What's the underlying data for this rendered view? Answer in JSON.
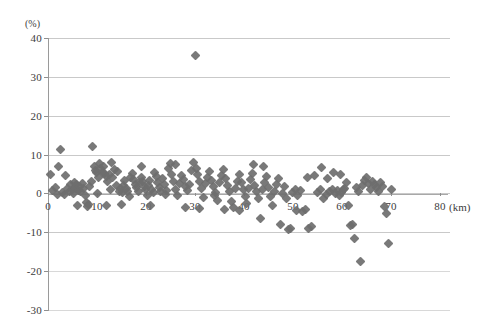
{
  "chart_data": {
    "type": "scatter",
    "title": "",
    "subtitle": "",
    "xlabel": "(km)",
    "ylabel": "(%)",
    "y_axis_title": "(%)",
    "x_axis_unit": "(km)",
    "xlim": [
      0,
      80
    ],
    "ylim": [
      -30,
      40
    ],
    "xticks": [
      0,
      10,
      20,
      30,
      40,
      50,
      60,
      70,
      80
    ],
    "xtick_labels": [
      "0",
      "10",
      "20",
      "30",
      "40",
      "50",
      "60",
      "70",
      "80"
    ],
    "yticks": [
      40,
      30,
      20,
      10,
      0,
      -10,
      -20,
      -30
    ],
    "ytick_labels": [
      "40",
      "30",
      "20",
      "10",
      "0",
      "-10",
      "-20",
      "-30"
    ],
    "grid": true,
    "grid_axis": "y",
    "legend": false,
    "legend_position": "none",
    "marker": "diamond",
    "marker_color": "#6e6e6e",
    "background_color": "#ffffff",
    "gridline_color": "#c9c9c9",
    "axis_color": "#8f8f8f",
    "series": [
      {
        "name": "series-1",
        "points": [
          [
            0.4,
            5.0
          ],
          [
            1.0,
            0.7
          ],
          [
            1.6,
            1.6
          ],
          [
            2.2,
            6.9
          ],
          [
            2.6,
            11.2
          ],
          [
            3.0,
            0.2
          ],
          [
            3.3,
            -0.3
          ],
          [
            3.6,
            4.7
          ],
          [
            4.0,
            1.3
          ],
          [
            4.3,
            0.6
          ],
          [
            4.6,
            2.2
          ],
          [
            4.9,
            1.0
          ],
          [
            5.2,
            0.1
          ],
          [
            5.4,
            2.9
          ],
          [
            5.6,
            1.2
          ],
          [
            5.9,
            2.4
          ],
          [
            6.2,
            0.8
          ],
          [
            6.4,
            1.9
          ],
          [
            6.7,
            0.4
          ],
          [
            7.0,
            2.6
          ],
          [
            7.3,
            1.4
          ],
          [
            7.6,
            -0.6
          ],
          [
            7.9,
            -2.4
          ],
          [
            8.2,
            -2.8
          ],
          [
            8.5,
            1.8
          ],
          [
            8.8,
            3.0
          ],
          [
            9.1,
            12.2
          ],
          [
            9.4,
            6.9
          ],
          [
            9.6,
            6.0
          ],
          [
            9.9,
            5.4
          ],
          [
            10.2,
            4.2
          ],
          [
            10.5,
            7.6
          ],
          [
            10.8,
            6.3
          ],
          [
            11.1,
            5.5
          ],
          [
            11.3,
            7.0
          ],
          [
            11.6,
            5.1
          ],
          [
            11.9,
            4.3
          ],
          [
            12.2,
            3.1
          ],
          [
            12.5,
            4.8
          ],
          [
            12.8,
            1.0
          ],
          [
            13.1,
            4.0
          ],
          [
            13.5,
            6.2
          ],
          [
            13.9,
            2.0
          ],
          [
            14.2,
            5.7
          ],
          [
            14.5,
            0.6
          ],
          [
            14.8,
            1.4
          ],
          [
            15.1,
            0.2
          ],
          [
            15.4,
            2.1
          ],
          [
            15.7,
            3.3
          ],
          [
            16.0,
            1.2
          ],
          [
            16.3,
            0.5
          ],
          [
            16.6,
            -0.8
          ],
          [
            16.9,
            4.2
          ],
          [
            17.2,
            5.2
          ],
          [
            17.5,
            3.6
          ],
          [
            17.8,
            2.4
          ],
          [
            18.1,
            1.5
          ],
          [
            18.4,
            0.4
          ],
          [
            18.7,
            2.7
          ],
          [
            19.0,
            4.1
          ],
          [
            19.3,
            3.0
          ],
          [
            19.6,
            1.8
          ],
          [
            19.9,
            0.9
          ],
          [
            20.2,
            -0.4
          ],
          [
            20.5,
            2.0
          ],
          [
            20.8,
            3.4
          ],
          [
            21.1,
            1.1
          ],
          [
            21.5,
            0.3
          ],
          [
            21.8,
            5.5
          ],
          [
            22.1,
            4.4
          ],
          [
            22.4,
            2.8
          ],
          [
            22.7,
            1.6
          ],
          [
            23.0,
            0.6
          ],
          [
            23.4,
            3.9
          ],
          [
            23.8,
            2.2
          ],
          [
            24.1,
            0.8
          ],
          [
            24.5,
            6.5
          ],
          [
            24.9,
            7.8
          ],
          [
            25.2,
            5.0
          ],
          [
            25.6,
            3.2
          ],
          [
            26.0,
            1.0
          ],
          [
            26.4,
            -0.5
          ],
          [
            26.8,
            2.6
          ],
          [
            27.2,
            4.6
          ],
          [
            27.6,
            3.7
          ],
          [
            28.0,
            1.9
          ],
          [
            28.4,
            0.7
          ],
          [
            28.8,
            2.3
          ],
          [
            29.2,
            5.8
          ],
          [
            29.6,
            7.9
          ],
          [
            30.0,
            35.5
          ],
          [
            30.2,
            6.4
          ],
          [
            30.6,
            4.9
          ],
          [
            31.0,
            3.1
          ],
          [
            31.4,
            1.3
          ],
          [
            31.8,
            -1.0
          ],
          [
            32.2,
            2.5
          ],
          [
            32.6,
            4.0
          ],
          [
            33.0,
            5.6
          ],
          [
            33.4,
            3.4
          ],
          [
            33.8,
            1.7
          ],
          [
            34.2,
            0.2
          ],
          [
            34.6,
            -1.8
          ],
          [
            35.0,
            2.9
          ],
          [
            35.4,
            4.5
          ],
          [
            35.8,
            6.1
          ],
          [
            36.2,
            3.8
          ],
          [
            36.6,
            2.0
          ],
          [
            37.0,
            0.5
          ],
          [
            37.4,
            -2.0
          ],
          [
            37.8,
            -3.6
          ],
          [
            38.2,
            1.4
          ],
          [
            38.6,
            3.0
          ],
          [
            39.0,
            4.8
          ],
          [
            39.4,
            2.7
          ],
          [
            39.8,
            0.9
          ],
          [
            40.2,
            -0.7
          ],
          [
            40.6,
            -2.6
          ],
          [
            41.0,
            1.2
          ],
          [
            41.4,
            3.5
          ],
          [
            41.8,
            5.2
          ],
          [
            42.2,
            2.1
          ],
          [
            42.6,
            0.4
          ],
          [
            43.0,
            -1.4
          ],
          [
            43.4,
            -6.5
          ],
          [
            43.8,
            1.0
          ],
          [
            44.2,
            2.8
          ],
          [
            44.6,
            4.3
          ],
          [
            45.0,
            1.5
          ],
          [
            45.4,
            -0.9
          ],
          [
            45.8,
            -3.0
          ],
          [
            46.2,
            0.6
          ],
          [
            46.6,
            2.4
          ],
          [
            47.0,
            3.9
          ],
          [
            47.4,
            -7.9
          ],
          [
            47.8,
            0.1
          ],
          [
            48.2,
            1.8
          ],
          [
            48.6,
            -1.2
          ],
          [
            49.0,
            -9.3
          ],
          [
            49.4,
            -9.0
          ],
          [
            49.8,
            0.3
          ],
          [
            50.4,
            1.1
          ],
          [
            51.0,
            -0.5
          ],
          [
            51.6,
            0.8
          ],
          [
            52.0,
            -4.6
          ],
          [
            52.6,
            -4.2
          ],
          [
            53.2,
            -8.9
          ],
          [
            53.8,
            -8.6
          ],
          [
            54.4,
            4.6
          ],
          [
            55.0,
            0.2
          ],
          [
            55.6,
            0.9
          ],
          [
            56.2,
            -1.3
          ],
          [
            56.8,
            -0.2
          ],
          [
            57.4,
            0.5
          ],
          [
            58.0,
            1.0
          ],
          [
            58.6,
            0.1
          ],
          [
            59.0,
            0.7
          ],
          [
            59.4,
            -0.4
          ],
          [
            59.8,
            0.3
          ],
          [
            60.2,
            0.9
          ],
          [
            60.6,
            1.4
          ],
          [
            61.0,
            2.8
          ],
          [
            61.4,
            -3.2
          ],
          [
            61.8,
            -8.2
          ],
          [
            62.2,
            -7.9
          ],
          [
            62.6,
            -11.5
          ],
          [
            63.0,
            1.6
          ],
          [
            63.4,
            0.4
          ],
          [
            63.8,
            -17.6
          ],
          [
            64.2,
            2.0
          ],
          [
            64.6,
            3.4
          ],
          [
            65.0,
            4.2
          ],
          [
            65.4,
            2.6
          ],
          [
            65.8,
            1.1
          ],
          [
            66.2,
            3.0
          ],
          [
            66.6,
            2.2
          ],
          [
            67.0,
            1.5
          ],
          [
            67.4,
            0.6
          ],
          [
            67.8,
            2.9
          ],
          [
            68.2,
            1.8
          ],
          [
            68.6,
            -3.4
          ],
          [
            69.0,
            -5.2
          ],
          [
            69.4,
            -12.9
          ],
          [
            70.0,
            1.0
          ],
          [
            58.2,
            5.4
          ],
          [
            59.6,
            5.0
          ],
          [
            57.0,
            3.9
          ],
          [
            55.8,
            6.6
          ],
          [
            53.0,
            4.0
          ],
          [
            50.8,
            -4.5
          ],
          [
            44.0,
            7.0
          ],
          [
            42.0,
            7.4
          ],
          [
            26.0,
            7.5
          ],
          [
            19.0,
            7.0
          ],
          [
            13.0,
            8.0
          ],
          [
            6.0,
            -3.1
          ],
          [
            8.0,
            -3.3
          ],
          [
            12.0,
            -3.0
          ],
          [
            15.0,
            -2.8
          ],
          [
            21.0,
            -3.2
          ],
          [
            28.0,
            -3.5
          ],
          [
            31.0,
            -3.9
          ],
          [
            36.0,
            -4.0
          ],
          [
            39.0,
            -4.4
          ],
          [
            2.0,
            -0.2
          ],
          [
            10.0,
            0.1
          ],
          [
            24.0,
            -0.3
          ],
          [
            34.0,
            -0.6
          ]
        ]
      }
    ]
  },
  "axes": {
    "y_title": "(%)",
    "x_unit": "(km)"
  }
}
